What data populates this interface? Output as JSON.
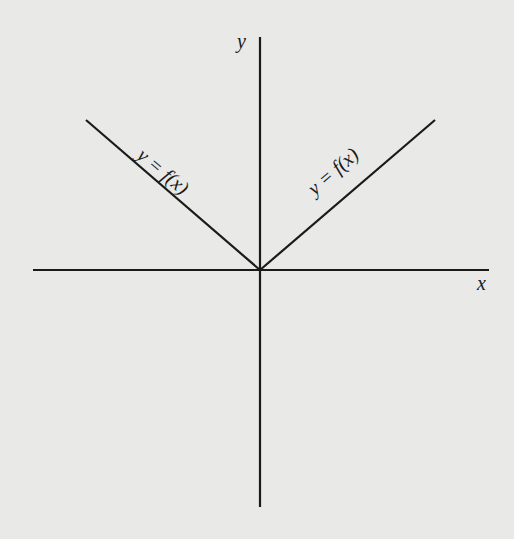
{
  "diagram": {
    "type": "function-graph",
    "colors": {
      "background": "#e9e9e7",
      "ink": "#1a1a1a"
    },
    "axes": {
      "x_label": "x",
      "y_label": "y"
    },
    "curves": [
      {
        "name": "left-ray",
        "label": "y = f(x)",
        "from": [
          0,
          0
        ],
        "to": [
          -1,
          0.86
        ]
      },
      {
        "name": "right-ray",
        "label": "y = f(x)",
        "from": [
          0,
          0
        ],
        "to": [
          1,
          0.86
        ]
      }
    ]
  }
}
